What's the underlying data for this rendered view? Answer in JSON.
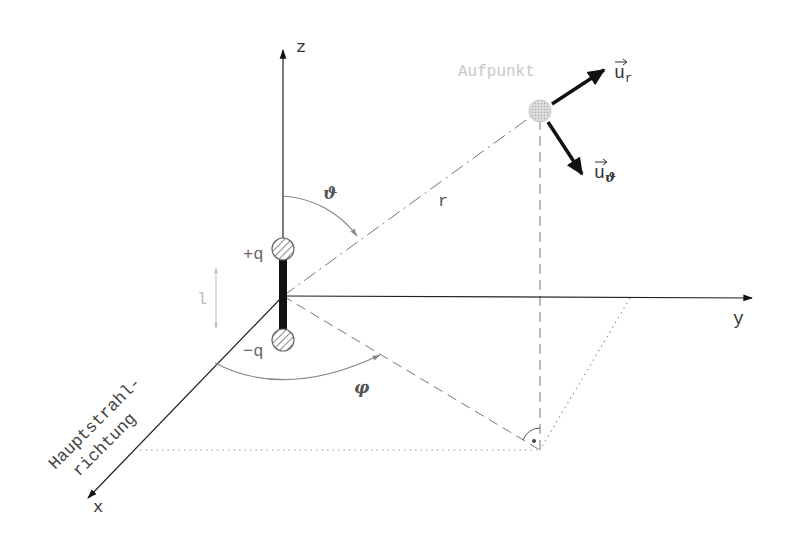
{
  "diagram": {
    "type": "hertz-dipole-coordinate-system",
    "axes": {
      "x_label": "x",
      "y_label": "y",
      "z_label": "z"
    },
    "labels": {
      "aufpunkt": "Aufpunkt",
      "r": "r",
      "theta": "ϑ",
      "phi": "φ",
      "plus_q": "+q",
      "minus_q": "−q",
      "length": "l",
      "hauptstrahl_line1": "Hauptstrahl-",
      "hauptstrahl_line2": "richtung",
      "u_r_base": "u",
      "u_r_sub": "r",
      "u_theta_base": "u",
      "u_theta_sub": "ϑ"
    },
    "colors": {
      "axis": "#111111",
      "construction": "#777777",
      "faint_text": "#c8c8c8",
      "charge_fill": "#dddddd",
      "aufpunkt_fill": "#cfcfcf"
    }
  }
}
